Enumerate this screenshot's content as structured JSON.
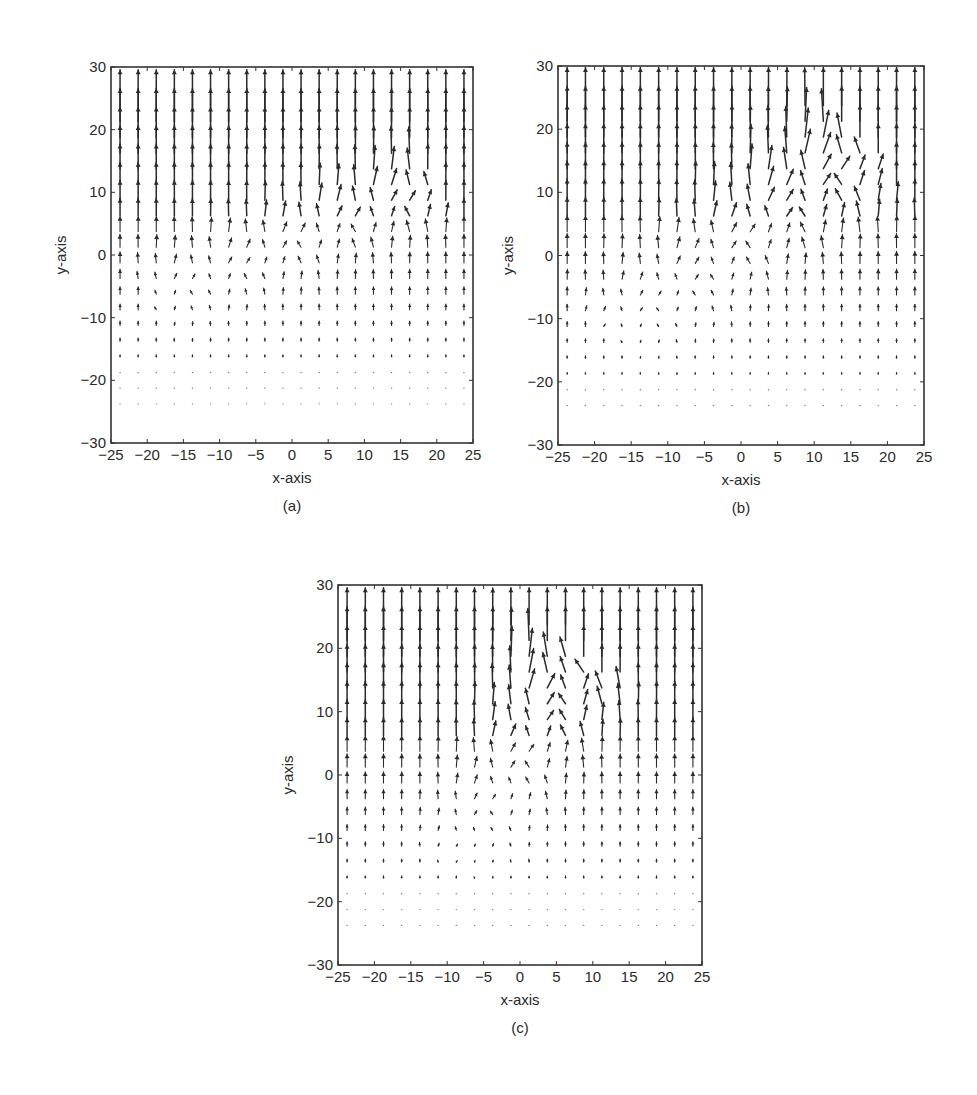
{
  "header_fragment": {
    "text": "... g   g   ...   ,   ..."
  },
  "chart_data": [
    {
      "type": "quiver",
      "panel": "a",
      "caption": "(a)",
      "xlabel": "x-axis",
      "ylabel": "y-axis",
      "xlim": [
        -25,
        25
      ],
      "ylim": [
        -30,
        30
      ],
      "xticks": [
        -25,
        -20,
        -15,
        -10,
        -5,
        0,
        5,
        10,
        15,
        20,
        25
      ],
      "yticks": [
        -30,
        -20,
        -10,
        0,
        10,
        20,
        30
      ],
      "grid": false,
      "grid_x": {
        "start": -23.75,
        "step": 2.5,
        "count": 20
      },
      "grid_y": {
        "start": -23.75,
        "step": 2.5,
        "count": 20
      },
      "field": {
        "max_length": 2.6,
        "top_y": 26,
        "fade_bottom_y": -24,
        "disturbance": {
          "x1": -18,
          "y1": -7,
          "x2": 18,
          "y2": 9,
          "width": 3.5,
          "tilt": 0.55
        }
      },
      "box_px": {
        "left": 111,
        "top": 67,
        "right": 473,
        "bottom": 443
      }
    },
    {
      "type": "quiver",
      "panel": "b",
      "caption": "(b)",
      "xlabel": "x-axis",
      "ylabel": "y-axis",
      "xlim": [
        -25,
        25
      ],
      "ylim": [
        -30,
        30
      ],
      "xticks": [
        -25,
        -20,
        -15,
        -10,
        -5,
        0,
        5,
        10,
        15,
        20,
        25
      ],
      "yticks": [
        -30,
        -20,
        -10,
        0,
        10,
        20,
        30
      ],
      "grid": false,
      "grid_x": {
        "start": -23.75,
        "step": 2.5,
        "count": 20
      },
      "grid_y": {
        "start": -23.75,
        "step": 2.5,
        "count": 20
      },
      "field": {
        "max_length": 2.7,
        "top_y": 26,
        "fade_bottom_y": -25,
        "disturbance": {
          "x1": -16,
          "y1": -12,
          "x2": 16,
          "y2": 14,
          "width": 4.5,
          "tilt": 0.6
        }
      },
      "box_px": {
        "left": 558,
        "top": 66,
        "right": 924,
        "bottom": 445
      }
    },
    {
      "type": "quiver",
      "panel": "c",
      "caption": "(c)",
      "xlabel": "x-axis",
      "ylabel": "y-axis",
      "xlim": [
        -25,
        25
      ],
      "ylim": [
        -30,
        30
      ],
      "xticks": [
        -25,
        -20,
        -15,
        -10,
        -5,
        0,
        5,
        10,
        15,
        20,
        25
      ],
      "yticks": [
        -30,
        -20,
        -10,
        0,
        10,
        20,
        30
      ],
      "grid": false,
      "grid_x": {
        "start": -23.75,
        "step": 2.5,
        "count": 20
      },
      "grid_y": {
        "start": -23.75,
        "step": 2.5,
        "count": 20
      },
      "field": {
        "max_length": 2.6,
        "top_y": 26,
        "fade_bottom_y": -24,
        "disturbance": {
          "x1": -8,
          "y1": -14,
          "x2": 8,
          "y2": 16,
          "width": 4.0,
          "tilt": 0.6
        }
      },
      "box_px": {
        "left": 338,
        "top": 585,
        "right": 702,
        "bottom": 965
      }
    }
  ],
  "style": {
    "ink": "#2a2a2a",
    "axis": "#333333"
  }
}
